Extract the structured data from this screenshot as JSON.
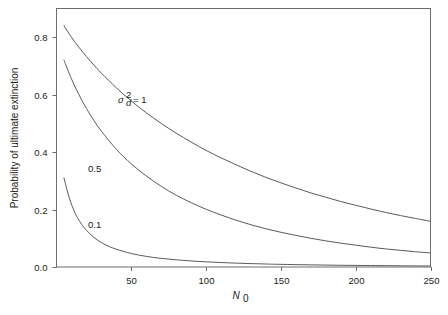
{
  "chart_data": {
    "type": "line",
    "title": "",
    "xlabel": "N0",
    "xlabel_base": "N",
    "xlabel_sub": "0",
    "ylabel": "Probability of ultimate extinction",
    "xlim": [
      0,
      250
    ],
    "ylim": [
      0.0,
      0.9
    ],
    "xticks": [
      50,
      100,
      150,
      200,
      250
    ],
    "xtick_labels": [
      "50",
      "100",
      "150",
      "200",
      "250"
    ],
    "yticks": [
      0.0,
      0.2,
      0.4,
      0.6,
      0.8
    ],
    "ytick_labels": [
      "0.0",
      "0.2",
      "0.4",
      "0.6",
      "0.8"
    ],
    "grid": false,
    "legend_position": "inline-annotations",
    "annotations": [
      {
        "name": "sigma-d-squared-equals-1",
        "text": "sd2 = 1",
        "sigma": "σ",
        "sub": "d",
        "sup": "2",
        "rest": "= 1",
        "x_px": 118,
        "y_px": 103
      },
      {
        "name": "curve-label-0-5",
        "text": "0.5",
        "x_px": 88,
        "y_px": 172
      },
      {
        "name": "curve-label-0-1",
        "text": "0.1",
        "x_px": 88,
        "y_px": 228
      }
    ],
    "series": [
      {
        "name": "sigma_d^2 = 1",
        "label": "1",
        "color": "#5a5a5a",
        "x": [
          5,
          10,
          15,
          20,
          25,
          30,
          40,
          50,
          60,
          70,
          80,
          90,
          100,
          110,
          120,
          130,
          140,
          150,
          160,
          170,
          180,
          190,
          200,
          210,
          220,
          230,
          240,
          250
        ],
        "y": [
          0.84,
          0.8,
          0.765,
          0.733,
          0.703,
          0.675,
          0.624,
          0.578,
          0.537,
          0.5,
          0.466,
          0.435,
          0.406,
          0.38,
          0.356,
          0.333,
          0.312,
          0.293,
          0.275,
          0.258,
          0.243,
          0.228,
          0.215,
          0.202,
          0.19,
          0.179,
          0.169,
          0.159
        ]
      },
      {
        "name": "sigma_d^2 = 0.5",
        "label": "0.5",
        "color": "#5a5a5a",
        "x": [
          5,
          10,
          15,
          20,
          25,
          30,
          40,
          50,
          60,
          70,
          80,
          90,
          100,
          110,
          120,
          130,
          140,
          150,
          160,
          170,
          180,
          190,
          200,
          210,
          220,
          230,
          240,
          250
        ],
        "y": [
          0.72,
          0.655,
          0.6,
          0.552,
          0.51,
          0.473,
          0.41,
          0.359,
          0.317,
          0.281,
          0.25,
          0.224,
          0.201,
          0.181,
          0.163,
          0.147,
          0.133,
          0.121,
          0.11,
          0.1,
          0.091,
          0.083,
          0.076,
          0.069,
          0.063,
          0.058,
          0.053,
          0.049
        ]
      },
      {
        "name": "sigma_d^2 = 0.1",
        "label": "0.1",
        "color": "#5a5a5a",
        "x": [
          5,
          8,
          11,
          14,
          17,
          20,
          25,
          30,
          35,
          40,
          50,
          60,
          70,
          80,
          90,
          100,
          110,
          120,
          130,
          140,
          150,
          170,
          190,
          210,
          230,
          250
        ],
        "y": [
          0.31,
          0.25,
          0.205,
          0.172,
          0.147,
          0.128,
          0.103,
          0.085,
          0.072,
          0.062,
          0.047,
          0.037,
          0.03,
          0.025,
          0.021,
          0.018,
          0.0155,
          0.0135,
          0.0118,
          0.0104,
          0.0092,
          0.0074,
          0.006,
          0.005,
          0.0042,
          0.0035
        ]
      }
    ]
  },
  "figure": {
    "background_color": "#ffffff",
    "axis_color": "#6d6d6d",
    "text_color": "#1a1a1a"
  }
}
